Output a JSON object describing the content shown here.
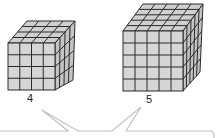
{
  "figure": {
    "cubes": [
      {
        "label": "4",
        "grid": 4
      },
      {
        "label": "5",
        "grid": 5
      }
    ],
    "colors": {
      "face": "#cfcfcf",
      "edge": "#2a2a2a",
      "callout": "#c8c8c8"
    }
  }
}
